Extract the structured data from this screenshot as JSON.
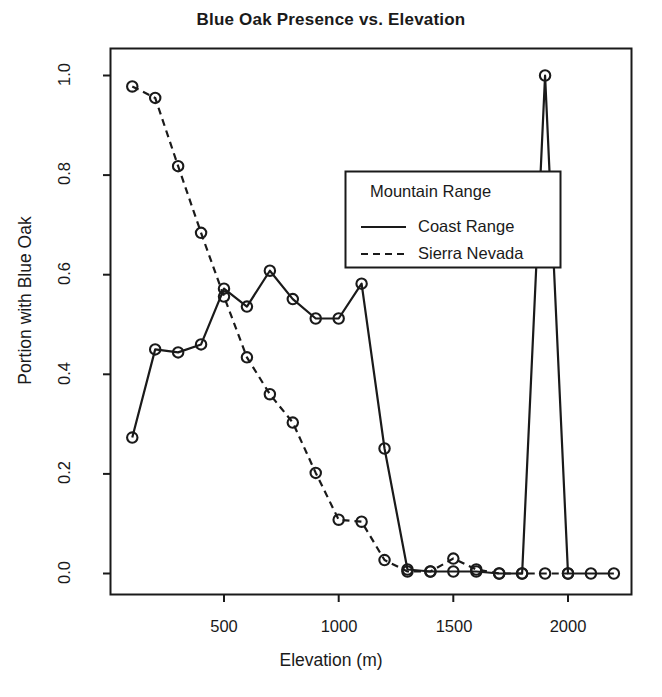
{
  "chart_data": {
    "type": "line",
    "title": "Blue Oak Presence vs. Elevation",
    "xlabel": "Elevation (m)",
    "ylabel": "Portion with Blue Oak",
    "xlim": [
      0,
      2250
    ],
    "ylim": [
      0.0,
      1.0
    ],
    "grid": false,
    "legend_position": "upper-center-right",
    "legend_title": "Mountain Range",
    "xticks": [
      500,
      1000,
      1500,
      2000
    ],
    "xtick_labels": [
      "500",
      "1000",
      "1500",
      "2000"
    ],
    "yticks": [
      0.0,
      0.2,
      0.4,
      0.6,
      0.8,
      1.0
    ],
    "ytick_labels": [
      "0.0",
      "0.2",
      "0.4",
      "0.6",
      "0.8",
      "1.0"
    ],
    "marker": "open-circle",
    "series": [
      {
        "name": "Coast Range",
        "linestyle": "solid",
        "color": "#1a1a1a",
        "x": [
          100,
          200,
          300,
          400,
          500,
          600,
          700,
          800,
          900,
          1000,
          1100,
          1200,
          1300,
          1400,
          1500,
          1600,
          1700,
          1800,
          1900,
          2000,
          2100,
          2200
        ],
        "values": [
          0.273,
          0.45,
          0.444,
          0.46,
          0.572,
          0.536,
          0.608,
          0.551,
          0.512,
          0.512,
          0.582,
          0.251,
          0.008,
          0.004,
          0.004,
          0.004,
          0.0,
          0.0,
          1.0,
          0.0,
          0.0,
          0.0
        ]
      },
      {
        "name": "Sierra Nevada",
        "linestyle": "dashed",
        "color": "#1a1a1a",
        "x": [
          100,
          200,
          300,
          400,
          500,
          600,
          700,
          800,
          900,
          1000,
          1100,
          1200,
          1300,
          1400,
          1500,
          1600,
          1700,
          1800,
          1900,
          2000
        ],
        "values": [
          0.978,
          0.955,
          0.818,
          0.684,
          0.556,
          0.434,
          0.36,
          0.303,
          0.202,
          0.108,
          0.104,
          0.027,
          0.004,
          0.004,
          0.03,
          0.008,
          0.0,
          0.0,
          0.0,
          0.0
        ]
      }
    ]
  },
  "legend": {
    "title": "Mountain Range",
    "entries": [
      {
        "label": "Coast Range",
        "style": "solid"
      },
      {
        "label": "Sierra Nevada",
        "style": "dashed"
      }
    ]
  },
  "axes": {
    "x_ticks": [
      "500",
      "1000",
      "1500",
      "2000"
    ],
    "y_ticks": [
      "0.0",
      "0.2",
      "0.4",
      "0.6",
      "0.8",
      "1.0"
    ]
  }
}
